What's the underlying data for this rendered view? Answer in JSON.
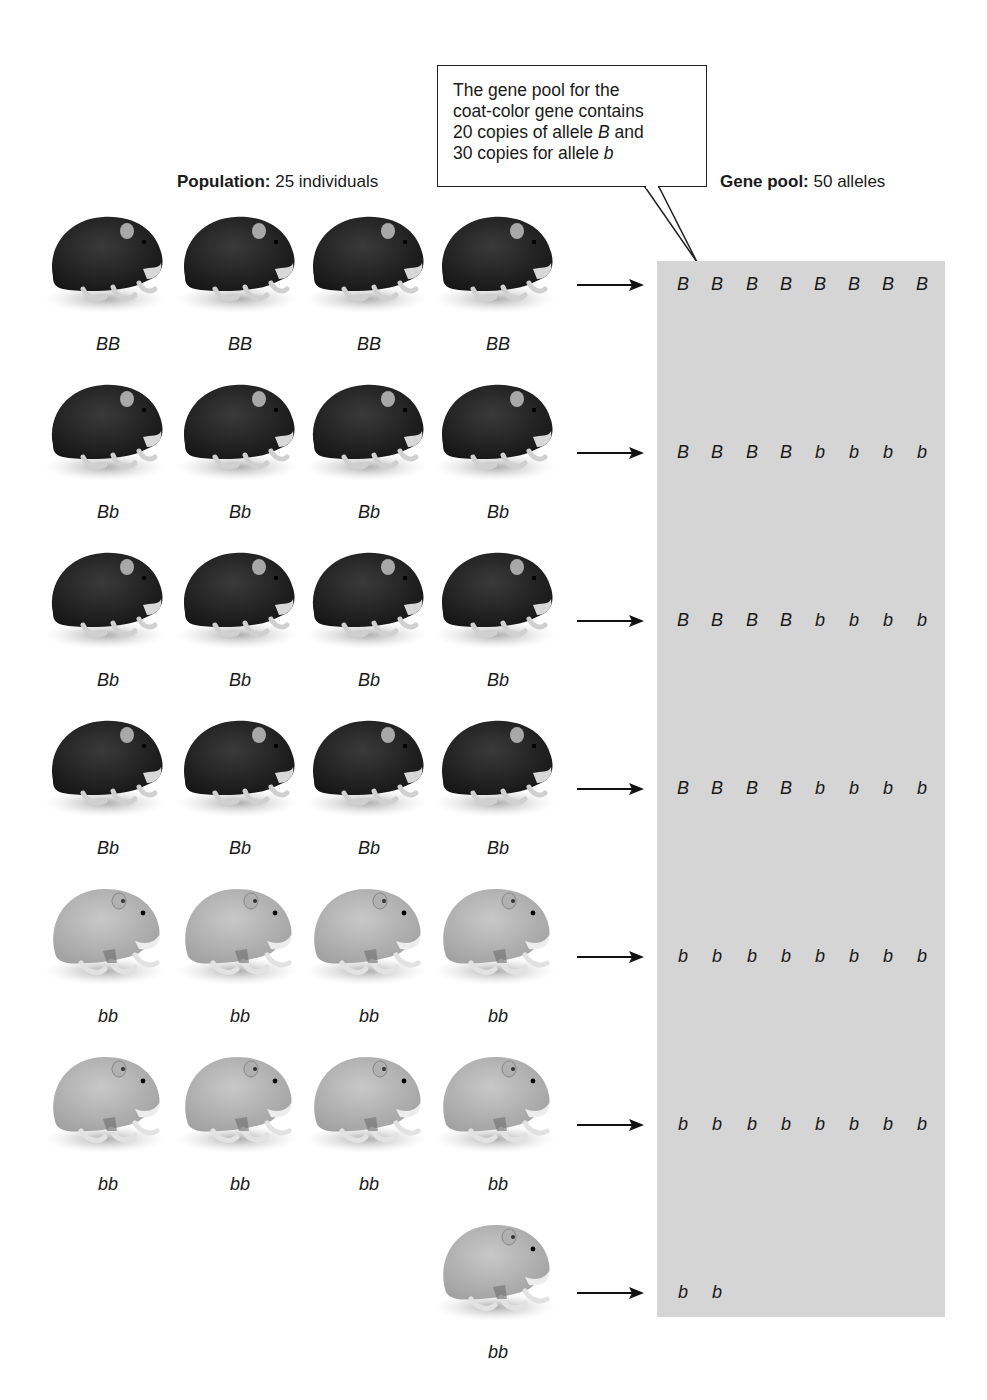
{
  "callout": {
    "lines": [
      "The gene pool for the",
      "coat-color gene contains",
      "20 copies of allele ",
      "30 copies for allele "
    ],
    "line3_italic": "B",
    "line3_tail": " and",
    "line4_italic": "b"
  },
  "population_heading": {
    "bold": "Population:",
    "text": " 25 individuals"
  },
  "genepool_heading": {
    "bold": "Gene pool:",
    "text": " 50 alleles"
  },
  "colors": {
    "dark_hamster": "#262626",
    "light_hamster": "#b9b9b9",
    "pool_bg": "#d5d5d5"
  },
  "rows": [
    {
      "genotypes": [
        "BB",
        "BB",
        "BB",
        "BB"
      ],
      "coat": "dark",
      "alleles": [
        "B",
        "B",
        "B",
        "B",
        "B",
        "B",
        "B",
        "B"
      ]
    },
    {
      "genotypes": [
        "Bb",
        "Bb",
        "Bb",
        "Bb"
      ],
      "coat": "dark",
      "alleles": [
        "B",
        "B",
        "B",
        "B",
        "b",
        "b",
        "b",
        "b"
      ]
    },
    {
      "genotypes": [
        "Bb",
        "Bb",
        "Bb",
        "Bb"
      ],
      "coat": "dark",
      "alleles": [
        "B",
        "B",
        "B",
        "B",
        "b",
        "b",
        "b",
        "b"
      ]
    },
    {
      "genotypes": [
        "Bb",
        "Bb",
        "Bb",
        "Bb"
      ],
      "coat": "dark",
      "alleles": [
        "B",
        "B",
        "B",
        "B",
        "b",
        "b",
        "b",
        "b"
      ]
    },
    {
      "genotypes": [
        "bb",
        "bb",
        "bb",
        "bb"
      ],
      "coat": "light",
      "alleles": [
        "b",
        "b",
        "b",
        "b",
        "b",
        "b",
        "b",
        "b"
      ]
    },
    {
      "genotypes": [
        "bb",
        "bb",
        "bb",
        "bb"
      ],
      "coat": "light",
      "alleles": [
        "b",
        "b",
        "b",
        "b",
        "b",
        "b",
        "b",
        "b"
      ]
    },
    {
      "genotypes": [
        null,
        null,
        null,
        "bb"
      ],
      "coat": "light",
      "alleles": [
        "b",
        "b"
      ]
    }
  ]
}
